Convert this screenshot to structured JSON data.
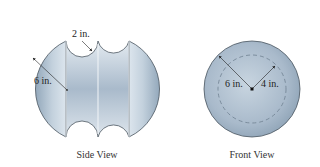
{
  "side_view": {
    "caption": "Side View",
    "labels": {
      "outer_radius": "6 in.",
      "notch_radius": "2 in."
    }
  },
  "front_view": {
    "caption": "Front View",
    "labels": {
      "outer_radius": "6 in.",
      "inner_radius": "4 in."
    }
  },
  "colors": {
    "fill_light": "#dfe7ee",
    "fill_mid": "#b9c8d6",
    "fill_dark": "#8ea3b6",
    "outline": "#4a5560",
    "dimension_line": "#222222"
  }
}
